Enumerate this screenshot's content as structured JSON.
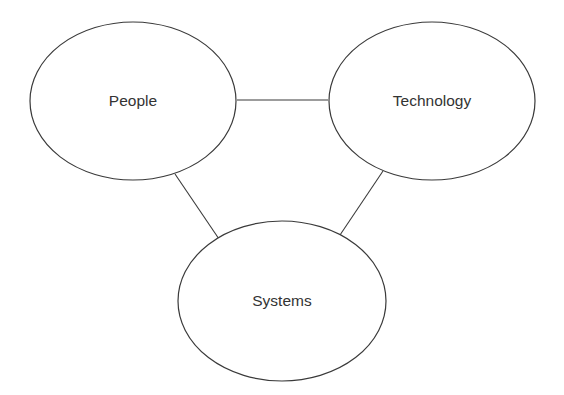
{
  "diagram": {
    "type": "relationship-triangle",
    "colors": {
      "stroke": "#3a3a3a",
      "text": "#333333",
      "background": "#ffffff"
    },
    "nodes": [
      {
        "id": "people",
        "label": "People",
        "cx": 133,
        "cy": 101,
        "rx": 103,
        "ry": 79
      },
      {
        "id": "technology",
        "label": "Technology",
        "cx": 432,
        "cy": 101,
        "rx": 103,
        "ry": 79
      },
      {
        "id": "systems",
        "label": "Systems",
        "cx": 282,
        "cy": 301,
        "rx": 104,
        "ry": 80
      }
    ],
    "edges": [
      {
        "from": "people",
        "to": "technology",
        "x1": 237,
        "y1": 100,
        "x2": 328,
        "y2": 100
      },
      {
        "from": "people",
        "to": "systems",
        "x1": 175,
        "y1": 174,
        "x2": 219,
        "y2": 239
      },
      {
        "from": "technology",
        "to": "systems",
        "x1": 383,
        "y1": 171,
        "x2": 340,
        "y2": 235
      }
    ]
  }
}
